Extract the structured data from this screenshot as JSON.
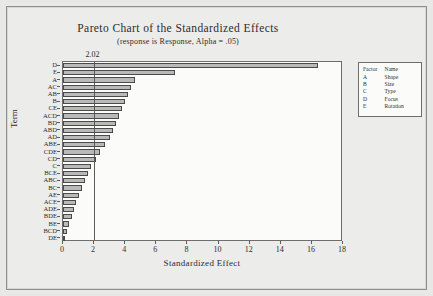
{
  "chart_data": {
    "type": "bar",
    "orientation": "horizontal",
    "title": "Pareto Chart of the Standardized Effects",
    "subtitle": "(response is Response, Alpha = .05)",
    "xlabel": "Standardized Effect",
    "ylabel": "Term",
    "xlim": [
      0,
      18
    ],
    "xticks": [
      0,
      2,
      4,
      6,
      8,
      10,
      12,
      14,
      16,
      18
    ],
    "grid": false,
    "reference_line": {
      "value": 2.02,
      "label": "2.02"
    },
    "categories": [
      "D",
      "E",
      "A",
      "AC",
      "AB",
      "B",
      "CE",
      "ACD",
      "BD",
      "ABD",
      "AD",
      "ABE",
      "CDE",
      "CD",
      "C",
      "BCE",
      "ABC",
      "BC",
      "AE",
      "ACE",
      "ADE",
      "BDE",
      "BE",
      "BCD",
      "DE"
    ],
    "values": [
      16.4,
      7.2,
      4.6,
      4.4,
      4.2,
      4.0,
      3.8,
      3.6,
      3.4,
      3.2,
      3.0,
      2.7,
      2.4,
      2.1,
      1.8,
      1.6,
      1.4,
      1.2,
      1.0,
      0.85,
      0.7,
      0.55,
      0.4,
      0.28,
      0.15
    ],
    "bar_color": "#b9b9b9",
    "bar_edge_color": "#4a4a4a"
  },
  "legend": {
    "headers": [
      "Factor",
      "Name"
    ],
    "rows": [
      {
        "factor": "A",
        "name": "Shape"
      },
      {
        "factor": "B",
        "name": "Size"
      },
      {
        "factor": "C",
        "name": "Type"
      },
      {
        "factor": "D",
        "name": "Focus"
      },
      {
        "factor": "E",
        "name": "Rotation"
      }
    ]
  }
}
